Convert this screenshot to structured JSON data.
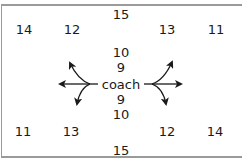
{
  "diagram": {
    "center_label": "coach",
    "center": {
      "x": 121,
      "y": 84
    },
    "labels": [
      {
        "id": "top-15",
        "text": "15",
        "x": 121,
        "y": 14
      },
      {
        "id": "top-left-14",
        "text": "14",
        "x": 24,
        "y": 29
      },
      {
        "id": "top-left-12",
        "text": "12",
        "x": 72,
        "y": 29
      },
      {
        "id": "top-right-13",
        "text": "13",
        "x": 167,
        "y": 29
      },
      {
        "id": "top-right-11",
        "text": "11",
        "x": 216,
        "y": 29
      },
      {
        "id": "upper-10",
        "text": "10",
        "x": 121,
        "y": 52
      },
      {
        "id": "upper-9",
        "text": "9",
        "x": 121,
        "y": 67
      },
      {
        "id": "lower-9",
        "text": "9",
        "x": 121,
        "y": 99
      },
      {
        "id": "lower-10",
        "text": "10",
        "x": 121,
        "y": 114
      },
      {
        "id": "bottom-left-11",
        "text": "11",
        "x": 23,
        "y": 131
      },
      {
        "id": "bottom-left-13",
        "text": "13",
        "x": 71,
        "y": 131
      },
      {
        "id": "bottom-right-12",
        "text": "12",
        "x": 167,
        "y": 131
      },
      {
        "id": "bottom-right-14",
        "text": "14",
        "x": 215,
        "y": 131
      },
      {
        "id": "bottom-15",
        "text": "15",
        "x": 121,
        "y": 150
      }
    ],
    "arrows": {
      "left_group": [
        "left",
        "up-left",
        "down-left"
      ],
      "right_group": [
        "right",
        "up-right",
        "down-right"
      ]
    },
    "colors": {
      "text": "#1a1a1a",
      "arrow": "#1a1a1a",
      "border": "#9a9a9a"
    }
  }
}
